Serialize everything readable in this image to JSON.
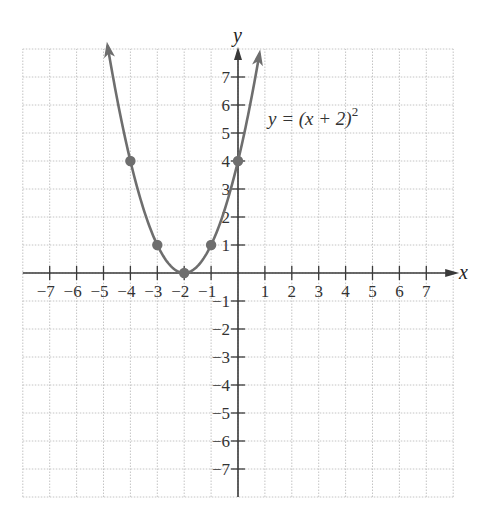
{
  "chart_data": {
    "type": "line",
    "title": "",
    "xlabel": "x",
    "ylabel": "y",
    "xlim": [
      -8,
      8
    ],
    "ylim": [
      -8,
      8
    ],
    "grid": true,
    "grid_style": "dotted",
    "x_ticks": [
      -7,
      -6,
      -5,
      -4,
      -3,
      -2,
      -1,
      1,
      2,
      3,
      4,
      5,
      6,
      7
    ],
    "y_ticks": [
      -7,
      -6,
      -5,
      -4,
      -3,
      -2,
      -1,
      1,
      2,
      3,
      4,
      5,
      6,
      7
    ],
    "x_tick_labels": [
      "−7",
      "−6",
      "−5",
      "−4",
      "−3",
      "−2",
      "−1",
      "1",
      "2",
      "3",
      "4",
      "5",
      "6",
      "7"
    ],
    "y_tick_labels": [
      "−7",
      "−6",
      "−5",
      "−4",
      "−3",
      "−2",
      "−1",
      "1",
      "2",
      "3",
      "4",
      "5",
      "6",
      "7"
    ],
    "series": [
      {
        "name": "y = (x + 2)^2",
        "function": "(x+2)^2",
        "x_range": [
          -4.85,
          0.8
        ],
        "arrows_both_ends": true,
        "color": "#6e6e6e",
        "points": [
          {
            "x": -4,
            "y": 4
          },
          {
            "x": -3,
            "y": 1
          },
          {
            "x": -2,
            "y": 0
          },
          {
            "x": -1,
            "y": 1
          },
          {
            "x": 0,
            "y": 4
          }
        ]
      }
    ],
    "annotations": [
      {
        "text": "y = (x + 2)^2",
        "x": 1.1,
        "y": 5.5
      }
    ]
  },
  "labels": {
    "x_axis": "x",
    "y_axis": "y",
    "equation_main": "y = (x + 2)",
    "equation_exp": "2"
  }
}
